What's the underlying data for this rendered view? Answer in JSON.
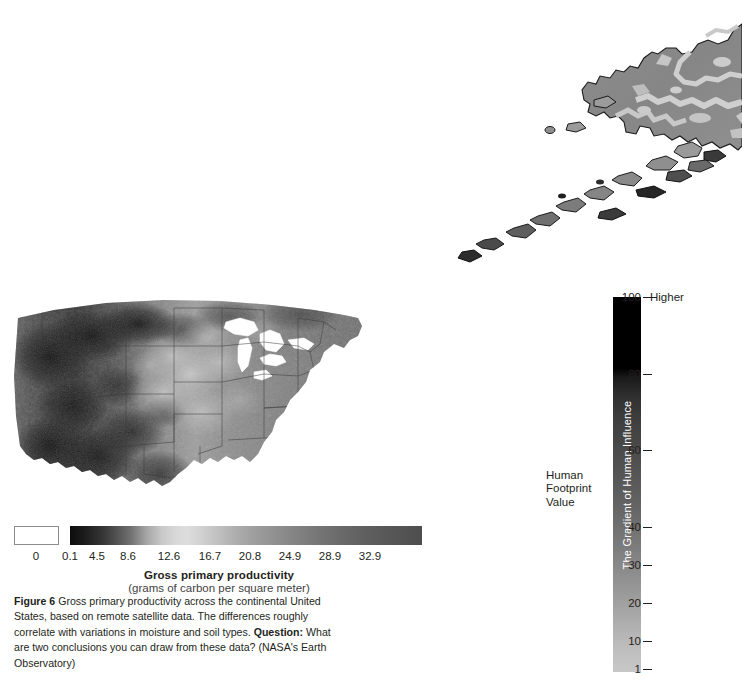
{
  "figure": {
    "us_map": {
      "alt": "Grayscale satellite map of gross primary productivity across the continental United States"
    },
    "colorbar": {
      "zero_swatch_label": "0",
      "ticks": [
        "0",
        "0.1",
        "4.5",
        "8.6",
        "12.6",
        "16.7",
        "20.8",
        "24.9",
        "28.9",
        "32.9"
      ],
      "title": "Gross primary productivity",
      "subtitle": "(grams of carbon per square meter)"
    },
    "caption": {
      "label": "Figure 6",
      "text_1": "  Gross primary productivity across the continental United States, based on remote satellite data. The differences roughly correlate with variations in moisture and soil types. ",
      "question_label": "Question:",
      "text_2": " What are two conclusions you can draw from these data? (NASA's Earth Observatory)"
    }
  },
  "human_footprint": {
    "map": {
      "alt": "Partial grayscale map of southwest Alaska and the Aleutian Islands showing human influence"
    },
    "legend": {
      "top_label": "Higher",
      "side_label_line1": "Human",
      "side_label_line2": "Footprint",
      "side_label_line3": "Value",
      "bar_title": "The Gradient of Human Influence",
      "ticks": [
        {
          "value": "100",
          "pos": 0.0
        },
        {
          "value": "80",
          "pos": 0.205
        },
        {
          "value": "60",
          "pos": 0.408
        },
        {
          "value": "40",
          "pos": 0.612
        },
        {
          "value": "30",
          "pos": 0.714
        },
        {
          "value": "20",
          "pos": 0.816
        },
        {
          "value": "10",
          "pos": 0.918
        },
        {
          "value": "1",
          "pos": 0.993
        }
      ]
    }
  },
  "chart_data": [
    {
      "type": "heatmap",
      "title": "Gross primary productivity",
      "subtitle": "(grams of carbon per square meter)",
      "xlabel": "",
      "ylabel": "",
      "colorbar_orientation": "horizontal",
      "colorbar_ticks": [
        0,
        0.1,
        4.5,
        8.6,
        12.6,
        16.7,
        20.8,
        24.9,
        28.9,
        32.9
      ],
      "colorbar_range": [
        0,
        32.9
      ],
      "colormap": "grayscale",
      "no_data_swatch": "0",
      "region": "Continental United States",
      "source": "NASA's Earth Observatory",
      "grid": false,
      "legend_position": "below"
    },
    {
      "type": "heatmap",
      "title": "The Gradient of Human Influence",
      "subtitle": "Human Footprint Value",
      "colorbar_orientation": "vertical",
      "colorbar_ticks": [
        100,
        80,
        60,
        40,
        30,
        20,
        10,
        1
      ],
      "colorbar_range": [
        1,
        100
      ],
      "colormap": "grayscale-inverted",
      "high_end_label": "Higher",
      "region": "Alaska / Aleutian Islands",
      "grid": false,
      "legend_position": "right"
    }
  ]
}
